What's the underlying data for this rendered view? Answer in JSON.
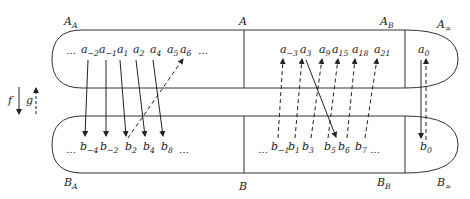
{
  "diagram": {
    "sets": {
      "top": {
        "name": "A",
        "regions": [
          {
            "label": "A",
            "sub": "A"
          },
          {
            "label": "A",
            "sub": ""
          },
          {
            "label": "A",
            "sub": "B"
          },
          {
            "label": "A",
            "sub": "∞"
          }
        ]
      },
      "bottom": {
        "name": "B",
        "regions": [
          {
            "label": "B",
            "sub": "A"
          },
          {
            "label": "B",
            "sub": ""
          },
          {
            "label": "B",
            "sub": "B"
          },
          {
            "label": "B",
            "sub": "∞"
          }
        ]
      }
    },
    "top_elements": {
      "A_A": [
        "…",
        "a_-2",
        "a_-1",
        "a_1",
        "a_2",
        "a_4",
        "a_5",
        "a_6",
        "…"
      ],
      "A_B": [
        "a_-3",
        "a_3",
        "a_9",
        "a_15",
        "a_18",
        "a_21"
      ],
      "A_inf": [
        "a_0"
      ]
    },
    "bottom_elements": {
      "B_A": [
        "…",
        "b_-4",
        "b_-2",
        "b_2",
        "b_4",
        "b_8",
        "…"
      ],
      "B_B": [
        "…",
        "b_-1",
        "b_1",
        "b_3",
        "b_5",
        "b_6",
        "b_7",
        "…"
      ],
      "B_inf": [
        "b_0"
      ]
    },
    "legend": {
      "f_label": "f",
      "g_label": "g",
      "f_style": "solid arrow down",
      "g_style": "dashed arrow up"
    },
    "f_arrows": [
      {
        "from": "a_-2",
        "to": "b_-4"
      },
      {
        "from": "a_-1",
        "to": "b_-2"
      },
      {
        "from": "a_1",
        "to": "b_2"
      },
      {
        "from": "a_2",
        "to": "b_4"
      },
      {
        "from": "a_4",
        "to": "b_8"
      },
      {
        "from": "a_3",
        "to": "b_6"
      },
      {
        "from": "a_0",
        "to": "b_0"
      }
    ],
    "g_arrows": [
      {
        "from": "b_2",
        "to": "a_6"
      },
      {
        "from": "b_-1",
        "to": "a_-3"
      },
      {
        "from": "b_1",
        "to": "a_3"
      },
      {
        "from": "b_3",
        "to": "a_9"
      },
      {
        "from": "b_5",
        "to": "a_15"
      },
      {
        "from": "b_6",
        "to": "a_18"
      },
      {
        "from": "b_7",
        "to": "a_21"
      },
      {
        "from": "b_0",
        "to": "a_0"
      }
    ],
    "colors": {
      "stroke": "#222222",
      "background": "#ffffff"
    }
  }
}
